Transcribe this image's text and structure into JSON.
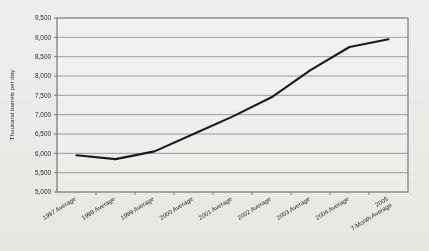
{
  "chart_data": {
    "type": "line",
    "title": "",
    "xlabel": "",
    "ylabel": "Thousand barrels per day",
    "categories": [
      "1997 Average",
      "1998 Average",
      "1999 Average",
      "2000 Average",
      "2001 Average",
      "2002 Average",
      "2003 Average",
      "2004 Average",
      "2005\n7-Month Average"
    ],
    "category_lines": [
      [
        "1997 Average"
      ],
      [
        "1998 Average"
      ],
      [
        "1999 Average"
      ],
      [
        "2000 Average"
      ],
      [
        "2001 Average"
      ],
      [
        "2002 Average"
      ],
      [
        "2003 Average"
      ],
      [
        "2004 Average"
      ],
      [
        "2005",
        "7-Month Average"
      ]
    ],
    "series": [
      {
        "name": "Thousand barrels per day",
        "values": [
          5950,
          5850,
          6050,
          6500,
          6950,
          7450,
          8150,
          8750,
          8950
        ],
        "color": "#1a1a1a"
      }
    ],
    "ylim": [
      5000,
      9500
    ],
    "ytick_values": [
      5000,
      5500,
      6000,
      6500,
      7000,
      7500,
      8000,
      8500,
      9000,
      9500
    ],
    "ytick_labels": [
      "5,000",
      "5,500",
      "6,000",
      "6,500",
      "7,000",
      "7,500",
      "8,000",
      "8,500",
      "9,000",
      "9,500"
    ],
    "grid": true,
    "grid_color": "#8c8c8c",
    "legend": "none",
    "plot_background": "#f2f2f0",
    "frame_color": "#6e6e6e"
  }
}
